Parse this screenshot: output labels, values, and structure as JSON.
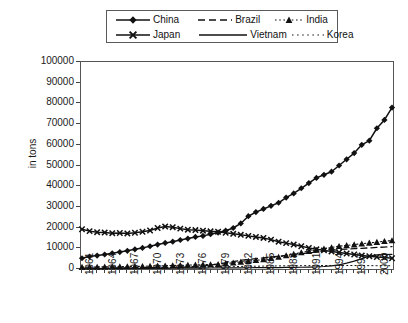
{
  "chart_data": {
    "type": "line",
    "title": "",
    "xlabel": "",
    "ylabel": "in tons",
    "ylim": [
      0,
      100000
    ],
    "ytick_step": 10000,
    "grid": false,
    "legend_position": "top",
    "x_tick_labels": [
      "1961",
      "1964",
      "1967",
      "1970",
      "1973",
      "1976",
      "1979",
      "1982",
      "1985",
      "1988",
      "1991",
      "1994",
      "1997",
      "2000"
    ],
    "x_tick_step": 3,
    "x": [
      1961,
      1962,
      1963,
      1964,
      1965,
      1966,
      1967,
      1968,
      1969,
      1970,
      1971,
      1972,
      1973,
      1974,
      1975,
      1976,
      1977,
      1978,
      1979,
      1980,
      1981,
      1982,
      1983,
      1984,
      1985,
      1986,
      1987,
      1988,
      1989,
      1990,
      1991,
      1992,
      1993,
      1994,
      1995,
      1996,
      1997,
      1998,
      1999,
      2000,
      2001,
      2002
    ],
    "yticks": [
      0,
      10000,
      20000,
      30000,
      40000,
      50000,
      60000,
      70000,
      80000,
      90000,
      100000
    ],
    "series": [
      {
        "name": "China",
        "marker": "diamond",
        "line_style": "solid",
        "color": "#111111",
        "values": [
          5200,
          6000,
          6500,
          7000,
          7600,
          8200,
          8800,
          9500,
          10200,
          11000,
          11800,
          12600,
          13200,
          14000,
          14700,
          15500,
          16000,
          16800,
          17600,
          18500,
          19800,
          22000,
          25500,
          27500,
          29000,
          30500,
          32000,
          34500,
          36500,
          39000,
          41500,
          44000,
          45500,
          47000,
          50000,
          53000,
          56000,
          60000,
          62000,
          68000,
          72000,
          78000
        ]
      },
      {
        "name": "Japan",
        "marker": "cross",
        "line_style": "solid",
        "color": "#111111",
        "values": [
          19200,
          18300,
          17800,
          17600,
          17300,
          17400,
          17200,
          17500,
          18000,
          18600,
          19800,
          20500,
          20200,
          19500,
          19000,
          18800,
          18500,
          18200,
          18000,
          17500,
          17000,
          16500,
          16000,
          15500,
          15000,
          14200,
          13200,
          12500,
          11800,
          11000,
          10200,
          9500,
          9000,
          8500,
          8000,
          7500,
          7000,
          6500,
          6200,
          5800,
          5500,
          5200
        ]
      },
      {
        "name": "India",
        "marker": "triangle",
        "line_style": "dotted",
        "color": "#111111",
        "values": [
          900,
          950,
          1000,
          1050,
          1100,
          1150,
          1200,
          1250,
          1300,
          1400,
          1500,
          1600,
          1700,
          1800,
          1900,
          2000,
          2100,
          2200,
          2300,
          2600,
          3000,
          3400,
          3800,
          4200,
          4600,
          5200,
          5800,
          6500,
          7200,
          8000,
          8600,
          9200,
          9800,
          10400,
          11000,
          11400,
          11800,
          12200,
          12600,
          13000,
          13400,
          13800
        ]
      },
      {
        "name": "Brazil",
        "marker": "none",
        "line_style": "dashed",
        "color": "#111111",
        "values": [
          400,
          420,
          440,
          460,
          480,
          500,
          520,
          560,
          600,
          650,
          700,
          760,
          820,
          900,
          1000,
          1200,
          1500,
          1900,
          2400,
          3000,
          3600,
          4200,
          4600,
          5000,
          5400,
          5800,
          6200,
          6600,
          7000,
          7400,
          7800,
          8200,
          8600,
          9000,
          9400,
          9600,
          9800,
          10000,
          10200,
          10400,
          10600,
          10800
        ]
      },
      {
        "name": "Vietnam",
        "marker": "none",
        "line_style": "solid-thin",
        "color": "#111111",
        "values": [
          200,
          210,
          220,
          230,
          240,
          250,
          260,
          270,
          280,
          300,
          320,
          340,
          360,
          380,
          400,
          420,
          450,
          480,
          500,
          520,
          550,
          580,
          600,
          620,
          650,
          680,
          700,
          750,
          800,
          850,
          900,
          1000,
          1200,
          1500,
          2000,
          2800,
          3800,
          5000,
          6200,
          6800,
          7000,
          7100
        ]
      },
      {
        "name": "Korea",
        "marker": "none",
        "line_style": "dotted-fine",
        "color": "#111111",
        "values": [
          300,
          320,
          340,
          360,
          380,
          400,
          430,
          460,
          500,
          540,
          580,
          620,
          660,
          700,
          760,
          820,
          900,
          980,
          1050,
          1120,
          1180,
          1240,
          1300,
          1350,
          1400,
          1450,
          1500,
          1550,
          1600,
          1620,
          1640,
          1660,
          1680,
          1700,
          1720,
          1700,
          1680,
          1650,
          1620,
          1600,
          1580,
          1560
        ]
      }
    ],
    "china_actual": [
      5200,
      6000,
      6500,
      7000,
      7600,
      8200,
      8800,
      9500,
      10200,
      11000,
      11800,
      12600,
      13200,
      14000,
      14700,
      15500,
      16000,
      16800,
      17600,
      18500,
      19800,
      22000,
      25500,
      27500,
      29000,
      30500,
      32000,
      34500,
      36500,
      39000,
      41500,
      44000,
      45500,
      47000,
      50000,
      53000,
      56000,
      60000,
      62000,
      68000,
      72000,
      78000
    ]
  },
  "legend": {
    "entries": [
      {
        "label": "China",
        "style": "solid-diamond"
      },
      {
        "label": "Brazil",
        "style": "dashed"
      },
      {
        "label": "India",
        "style": "dotted-triangle"
      },
      {
        "label": "Japan",
        "style": "solid-cross"
      },
      {
        "label": "Vietnam",
        "style": "solid-thin"
      },
      {
        "label": "Korea",
        "style": "dotted-fine"
      }
    ]
  },
  "axes": {
    "y_axis_label": "in tons",
    "y_tick_labels": [
      "100000",
      "90000",
      "80000",
      "70000",
      "60000",
      "50000",
      "40000",
      "30000",
      "20000",
      "10000",
      "0"
    ],
    "x_tick_labels": [
      "1961",
      "1964",
      "1967",
      "1970",
      "1973",
      "1976",
      "1979",
      "1982",
      "1985",
      "1988",
      "1991",
      "1994",
      "1997",
      "2000"
    ]
  }
}
